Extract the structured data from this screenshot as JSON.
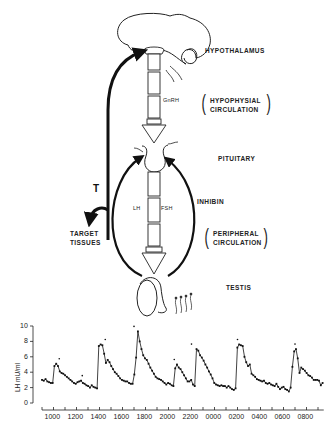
{
  "diagram": {
    "labels": {
      "hypothalamus": "HYPOTHALAMUS",
      "gnrh": "GnRH",
      "hypophysial_1": "HYPOPHYSIAL",
      "hypophysial_2": "CIRCULATION",
      "pituitary": "PITUITARY",
      "inhibin": "INHIBIN",
      "lh": "LH",
      "fsh": "FSH",
      "peripheral_1": "PERIPHERAL",
      "peripheral_2": "CIRCULATION",
      "testis": "TESTIS",
      "t": "T",
      "target_1": "TARGET",
      "target_2": "TISSUES"
    }
  },
  "chart_data": {
    "type": "line",
    "title": "",
    "xlabel": "",
    "ylabel": "LH mU/ml",
    "ylim": [
      0,
      10
    ],
    "yticks": [
      0,
      2,
      4,
      6,
      8,
      10
    ],
    "xtick_labels": [
      "1000",
      "1200",
      "1400",
      "1600",
      "1800",
      "2000",
      "2200",
      "0000",
      "0200",
      "0400",
      "0600",
      "0800"
    ],
    "grid": false,
    "legend": null,
    "pulse_markers_at_peaks": true,
    "note": "Series is a smoothed reconstruction: peak times and heights approximate the figure; intermediate points are estimates, not per-point readings.",
    "series": [
      {
        "name": "LH",
        "x_hours": [
          9.0,
          9.2,
          9.4,
          9.6,
          9.8,
          10.0,
          10.2,
          10.4,
          10.6,
          10.8,
          11.0,
          11.2,
          11.4,
          11.6,
          11.8,
          12.0,
          12.2,
          12.4,
          12.6,
          12.8,
          13.0,
          13.2,
          13.4,
          13.6,
          13.8,
          14.0,
          14.2,
          14.4,
          14.6,
          14.8,
          15.0,
          15.2,
          15.4,
          15.6,
          15.8,
          16.0,
          16.2,
          16.4,
          16.6,
          16.8,
          17.0,
          17.2,
          17.4,
          17.6,
          17.8,
          18.0,
          18.2,
          18.4,
          18.6,
          18.8,
          19.0,
          19.2,
          19.4,
          19.6,
          19.8,
          20.0,
          20.2,
          20.4,
          20.6,
          20.8,
          21.0,
          21.2,
          21.4,
          21.6,
          21.8,
          22.0,
          22.2,
          22.4,
          22.6,
          22.8,
          23.0,
          23.2,
          23.4,
          23.6,
          23.8,
          24.0,
          24.2,
          24.4,
          24.6,
          24.8,
          25.0,
          25.2,
          25.4,
          25.6,
          25.8,
          26.0,
          26.2,
          26.4,
          26.6,
          26.8,
          27.0,
          27.2,
          27.4,
          27.6,
          27.8,
          28.0,
          28.2,
          28.4,
          28.6,
          28.8,
          29.0,
          29.2,
          29.4,
          29.6,
          29.8,
          30.0,
          30.2,
          30.4,
          30.6,
          30.8,
          31.0,
          31.2,
          31.4,
          31.6,
          31.8,
          32.0,
          32.2,
          32.4,
          32.6,
          32.8,
          33.0,
          33.2,
          33.4
        ],
        "values": [
          3.0,
          2.9,
          3.1,
          2.8,
          2.7,
          2.6,
          2.6,
          4.8,
          5.1,
          4.8,
          4.1,
          3.9,
          3.8,
          3.6,
          3.4,
          3.2,
          3.0,
          2.8,
          2.6,
          2.5,
          2.7,
          2.8,
          2.9,
          2.6,
          2.5,
          2.3,
          2.2,
          2.0,
          2.3,
          2.1,
          2.0,
          1.9,
          7.4,
          7.6,
          7.5,
          6.4,
          5.2,
          5.6,
          5.3,
          4.8,
          4.4,
          4.0,
          3.8,
          3.5,
          3.2,
          3.0,
          2.9,
          2.8,
          2.8,
          2.6,
          2.5,
          2.5,
          3.7,
          5.9,
          9.3,
          8.0,
          7.0,
          6.2,
          5.8,
          5.6,
          5.1,
          4.6,
          4.2,
          3.8,
          3.4,
          3.2,
          3.1,
          3.0,
          2.8,
          2.6,
          2.4,
          2.6,
          2.5,
          2.3,
          2.2,
          4.5,
          5.0,
          4.6,
          4.4,
          4.0,
          3.6,
          3.2,
          2.8,
          2.8,
          3.0,
          2.4,
          2.2,
          7.0,
          6.8,
          6.2,
          5.9,
          5.5,
          5.0,
          4.6,
          4.1,
          3.7,
          3.2,
          2.6,
          2.4,
          2.3,
          2.2,
          2.3,
          2.2,
          2.2,
          2.0,
          2.2,
          2.0,
          1.8,
          1.7,
          1.9,
          7.2,
          7.6,
          7.5,
          7.4,
          6.0,
          5.3,
          4.8,
          5.0,
          3.8,
          3.6,
          3.4,
          3.1,
          3.0,
          2.9,
          2.8,
          2.9,
          2.6,
          2.5,
          2.6,
          2.4,
          2.3,
          2.2,
          2.5,
          2.1,
          1.8,
          2.0,
          2.1,
          1.8,
          1.7,
          1.5,
          2.0,
          4.7,
          6.7,
          7.0,
          5.8,
          3.9,
          4.6,
          4.4,
          4.2,
          3.9,
          3.6,
          3.5,
          3.3,
          3.0,
          3.0,
          3.0,
          2.9,
          2.3,
          2.6
        ]
      }
    ],
    "peaks": [
      {
        "time": "1030",
        "value": 5.1
      },
      {
        "time": "1230",
        "value": 2.9
      },
      {
        "time": "1430",
        "value": 7.6
      },
      {
        "time": "1700",
        "value": 9.3
      },
      {
        "time": "2030",
        "value": 5.0
      },
      {
        "time": "2200",
        "value": 7.0
      },
      {
        "time": "0200",
        "value": 7.6
      },
      {
        "time": "0700",
        "value": 7.0
      }
    ]
  }
}
